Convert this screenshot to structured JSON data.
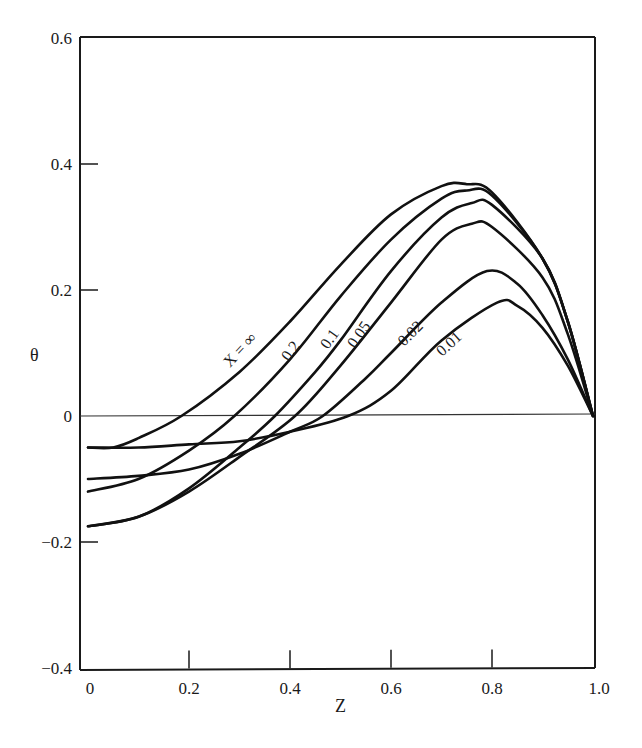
{
  "chart_data": {
    "type": "line",
    "title": "",
    "xlabel": "Z",
    "ylabel": "θ",
    "xlim": [
      0,
      1.0
    ],
    "ylim": [
      -0.4,
      0.6
    ],
    "grid": false,
    "legend_position": "inline labels on curves",
    "x_ticks": [
      "0",
      "0.2",
      "0.4",
      "0.6",
      "0.8",
      "1.0"
    ],
    "y_ticks": [
      "0.6",
      "0.4",
      "0.2",
      "0",
      "−0.2",
      "−0.4"
    ],
    "reference_line": {
      "y": 0,
      "label": "θ = 0 line"
    },
    "series": [
      {
        "name": "X = ∞",
        "label": "X = ∞",
        "x": [
          0,
          0.05,
          0.1,
          0.185,
          0.3,
          0.4,
          0.5,
          0.6,
          0.7,
          0.75,
          0.8,
          0.9,
          0.95,
          1.0
        ],
        "values": [
          -0.05,
          -0.05,
          -0.035,
          0.0,
          0.07,
          0.15,
          0.24,
          0.32,
          0.365,
          0.368,
          0.355,
          0.25,
          0.15,
          0.0
        ]
      },
      {
        "name": "X = 0.2",
        "label": "0.2",
        "x": [
          0,
          0.1,
          0.2,
          0.29,
          0.4,
          0.5,
          0.6,
          0.7,
          0.75,
          0.8,
          0.9,
          0.95,
          1.0
        ],
        "values": [
          -0.12,
          -0.1,
          -0.055,
          0.0,
          0.09,
          0.19,
          0.28,
          0.345,
          0.358,
          0.35,
          0.25,
          0.15,
          0.0
        ]
      },
      {
        "name": "X = 0.1",
        "label": "0.1",
        "x": [
          0,
          0.1,
          0.2,
          0.3,
          0.37,
          0.45,
          0.5,
          0.6,
          0.7,
          0.76,
          0.8,
          0.9,
          0.95,
          1.0
        ],
        "values": [
          -0.175,
          -0.16,
          -0.115,
          -0.05,
          0.0,
          0.07,
          0.12,
          0.23,
          0.315,
          0.338,
          0.335,
          0.25,
          0.15,
          0.0
        ]
      },
      {
        "name": "X = 0.05",
        "label": "0.05",
        "x": [
          0,
          0.1,
          0.2,
          0.3,
          0.41,
          0.5,
          0.6,
          0.7,
          0.76,
          0.8,
          0.9,
          0.95,
          1.0
        ],
        "values": [
          -0.175,
          -0.16,
          -0.12,
          -0.065,
          0.0,
          0.08,
          0.18,
          0.28,
          0.305,
          0.3,
          0.22,
          0.13,
          0.0
        ]
      },
      {
        "name": "X = 0.02",
        "label": "0.02",
        "x": [
          0,
          0.1,
          0.2,
          0.3,
          0.4,
          0.465,
          0.55,
          0.6,
          0.7,
          0.79,
          0.85,
          0.9,
          0.95,
          1.0
        ],
        "values": [
          -0.1,
          -0.095,
          -0.085,
          -0.06,
          -0.025,
          0.0,
          0.06,
          0.1,
          0.18,
          0.23,
          0.21,
          0.16,
          0.09,
          0.0
        ]
      },
      {
        "name": "X = 0.01",
        "label": "0.01",
        "x": [
          0,
          0.1,
          0.2,
          0.3,
          0.4,
          0.515,
          0.6,
          0.7,
          0.81,
          0.85,
          0.9,
          0.95,
          1.0
        ],
        "values": [
          -0.05,
          -0.05,
          -0.045,
          -0.04,
          -0.025,
          0.0,
          0.04,
          0.12,
          0.18,
          0.175,
          0.14,
          0.08,
          0.0
        ]
      }
    ]
  },
  "labels": {
    "xlabel": "Z",
    "ylabel": "θ",
    "x_ticks": [
      "0",
      "0.2",
      "0.4",
      "0.6",
      "0.8",
      "1.0"
    ],
    "y_ticks": [
      "0.6",
      "0.4",
      "0.2",
      "0",
      "−0.2",
      "−0.4"
    ],
    "curve_labels": [
      "X = ∞",
      "0.2",
      "0.1",
      "0.05",
      "0.02",
      "0.01"
    ]
  },
  "style": {
    "line_color": "#111111",
    "axis_color": "#1a1a1a",
    "background": "#ffffff"
  }
}
